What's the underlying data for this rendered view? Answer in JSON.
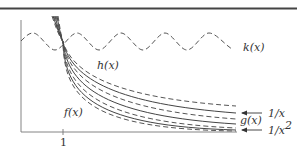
{
  "figure": {
    "x_tick_label": "1",
    "labels": {
      "k": "k(x)",
      "h": "h(x)",
      "f": "f(x)",
      "g": "g(x)",
      "inv_x": "1/x",
      "inv_x_sq_base": "1/x",
      "inv_x_sq_exp": "2"
    },
    "colors": {
      "ink": "#444444",
      "axis": "#777777",
      "background": "#ffffff"
    }
  }
}
